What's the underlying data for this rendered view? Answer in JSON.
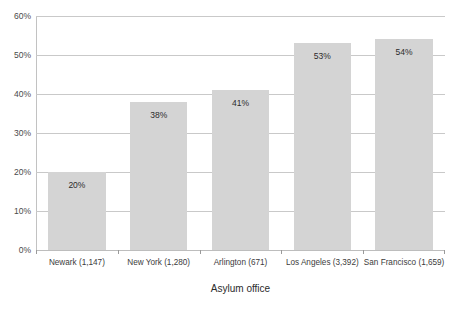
{
  "chart_data": {
    "type": "bar",
    "title": "",
    "xlabel": "Asylum office",
    "ylabel": "",
    "categories": [
      "Newark (1,147)",
      "New York (1,280)",
      "Arlington (671)",
      "Los Angeles (3,392)",
      "San Francisco (1,659)"
    ],
    "values": [
      20,
      38,
      41,
      53,
      54
    ],
    "value_labels": [
      "20%",
      "38%",
      "41%",
      "53%",
      "54%"
    ],
    "ylim": [
      0,
      60
    ],
    "ytick_labels": [
      "0%",
      "10%",
      "20%",
      "30%",
      "40%",
      "50%",
      "60%"
    ],
    "ytick_values": [
      0,
      10,
      20,
      30,
      40,
      50,
      60
    ],
    "grid": true,
    "legend": "none",
    "bar_color": "#d4d4d4",
    "gridline_color": "#c9c9c9",
    "text_color": "#333333"
  },
  "cropped_title": "",
  "axis": {
    "x_title": "Asylum office"
  }
}
